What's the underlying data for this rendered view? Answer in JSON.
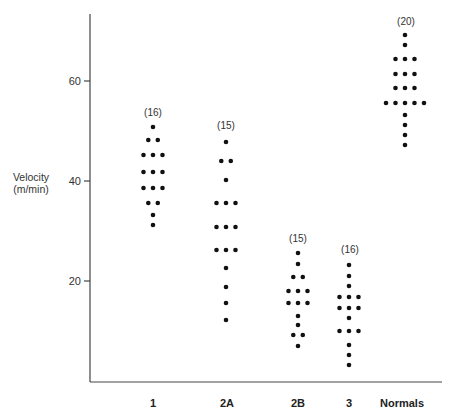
{
  "chart_data": {
    "type": "scatter",
    "subtype": "dot-plot",
    "title": "",
    "xlabel": "",
    "ylabel": "Velocity (m/min)",
    "ylabel_lines": [
      "Velocity",
      "(m/min)"
    ],
    "ylim": [
      0,
      72
    ],
    "yticks": [
      20,
      40,
      60
    ],
    "grid": false,
    "legend": null,
    "categories": [
      "1",
      "2A",
      "2B",
      "3",
      "Normals"
    ],
    "series": [
      {
        "name": "1",
        "count_label": "(16)",
        "rows": [
          [
            50.8,
            1
          ],
          [
            48.2,
            2
          ],
          [
            45.2,
            3
          ],
          [
            41.8,
            3
          ],
          [
            38.6,
            3
          ],
          [
            35.6,
            2
          ],
          [
            33.2,
            1
          ],
          [
            31.2,
            1
          ]
        ]
      },
      {
        "name": "2A",
        "count_label": "(15)",
        "rows": [
          [
            47.8,
            1
          ],
          [
            44.0,
            2
          ],
          [
            40.2,
            1
          ],
          [
            35.6,
            3
          ],
          [
            30.8,
            3
          ],
          [
            26.2,
            3
          ],
          [
            22.6,
            1
          ],
          [
            18.8,
            1
          ],
          [
            15.6,
            1
          ],
          [
            12.2,
            1
          ]
        ]
      },
      {
        "name": "2B",
        "count_label": "(15)",
        "rows": [
          [
            25.6,
            1
          ],
          [
            23.4,
            1
          ],
          [
            20.8,
            2
          ],
          [
            18.0,
            3
          ],
          [
            15.6,
            3
          ],
          [
            13.0,
            1
          ],
          [
            11.2,
            1
          ],
          [
            9.2,
            2
          ],
          [
            7.0,
            1
          ]
        ]
      },
      {
        "name": "3",
        "count_label": "(16)",
        "rows": [
          [
            23.2,
            1
          ],
          [
            21.0,
            1
          ],
          [
            19.0,
            1
          ],
          [
            16.8,
            3
          ],
          [
            14.6,
            3
          ],
          [
            12.6,
            1
          ],
          [
            10.0,
            3
          ],
          [
            7.2,
            1
          ],
          [
            5.2,
            1
          ],
          [
            3.2,
            1
          ]
        ]
      },
      {
        "name": "Normals",
        "count_label": "(20)",
        "rows": [
          [
            69.2,
            1
          ],
          [
            67.2,
            1
          ],
          [
            64.4,
            3
          ],
          [
            61.4,
            3
          ],
          [
            58.6,
            3
          ],
          [
            55.6,
            5
          ],
          [
            53.2,
            1
          ],
          [
            51.2,
            1
          ],
          [
            49.2,
            1
          ],
          [
            47.2,
            1
          ]
        ]
      }
    ]
  },
  "axis": {
    "y_label_line1": "Velocity",
    "y_label_line2": "(m/min)",
    "tick_labels": [
      "20",
      "40",
      "60"
    ]
  },
  "colors": {
    "dot": "#111111",
    "axis": "#444444",
    "text": "#333333",
    "background": "#ffffff"
  }
}
